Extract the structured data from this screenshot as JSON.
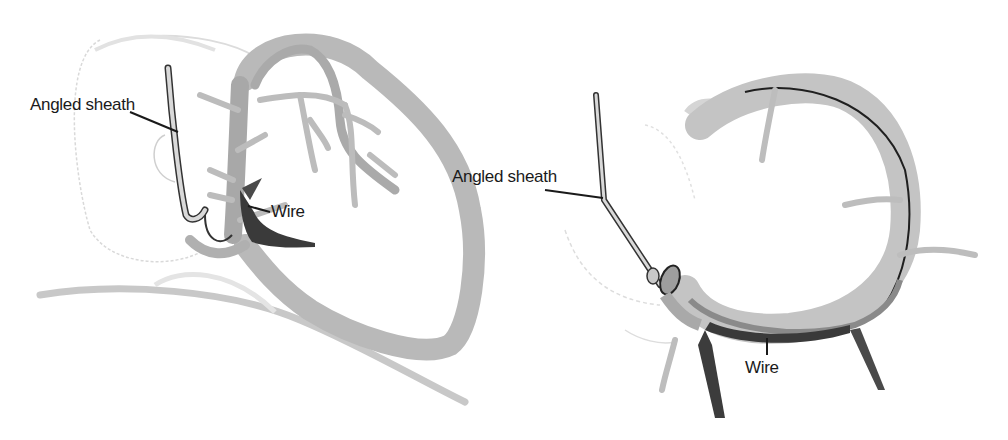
{
  "figure": {
    "panels": [
      {
        "id": "left",
        "view": "lateral heart view with coronary sinus",
        "labels": {
          "sheath": "Angled sheath",
          "wire": "Wire"
        }
      },
      {
        "id": "right",
        "view": "coronary sinus ring view",
        "labels": {
          "sheath": "Angled sheath",
          "wire": "Wire"
        }
      }
    ],
    "colors": {
      "background": "#ffffff",
      "vessel_light": "#bdbdbd",
      "vessel_mid": "#9a9a9a",
      "vessel_dark": "#3c3c3c",
      "outline": "#222222",
      "faint_outline": "#d6d6d6",
      "label_text": "#1a1a1a"
    }
  }
}
